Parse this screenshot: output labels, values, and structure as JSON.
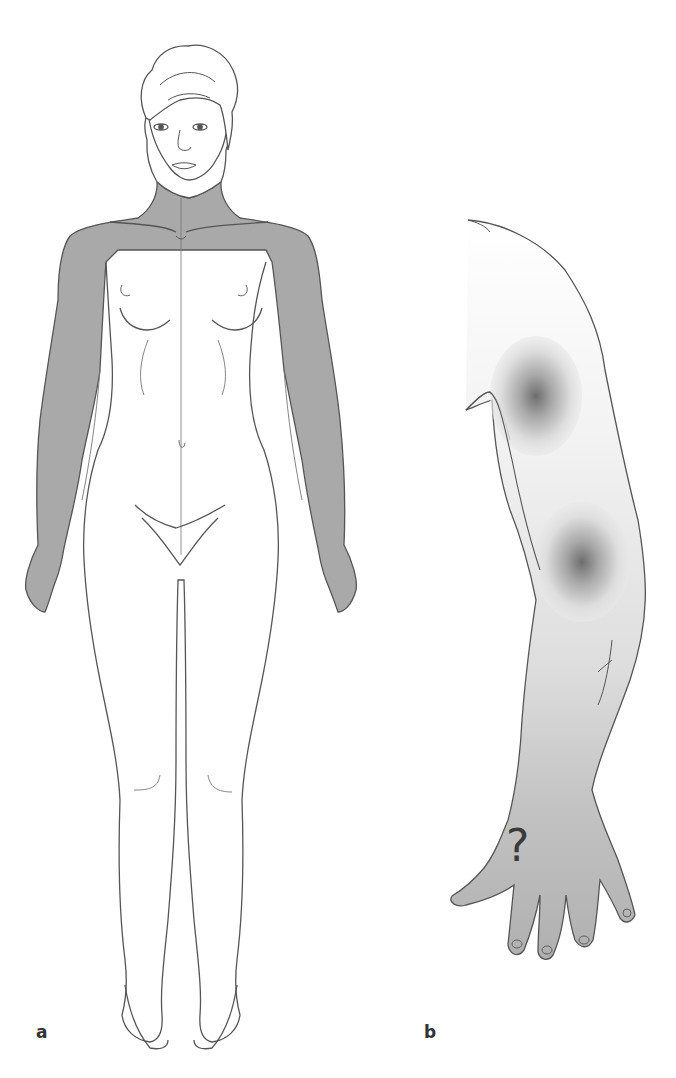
{
  "figure": {
    "panels": [
      {
        "id": "a",
        "label": "a",
        "description": "Female full-body front view; shaded area covers neck, shoulders and both arms down to hands"
      },
      {
        "id": "b",
        "label": "b",
        "description": "Lateral view of right arm with two gradient pain foci (shoulder and elbow) and shaded forearm/hand"
      }
    ],
    "hand_annotation": "?",
    "colors": {
      "shade": "#a9a9a9",
      "outline": "#555555",
      "light_shade": "#dcdcdc",
      "focus_center": "#777777"
    }
  }
}
